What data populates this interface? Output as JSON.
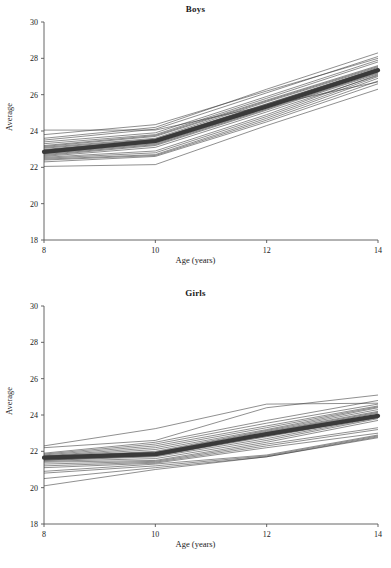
{
  "figure": {
    "width": 391,
    "height": 568,
    "background": "#ffffff",
    "line_color": "#333333",
    "mean_line_color": "#3a3a3a",
    "axis_color": "#555555"
  },
  "chart_data": [
    {
      "type": "line",
      "panel": "boys",
      "title": "Boys",
      "xlabel": "Age (years)",
      "ylabel": "Average",
      "x": [
        8,
        10,
        12,
        14
      ],
      "xlim": [
        8,
        14
      ],
      "ylim": [
        18,
        30
      ],
      "xticks": [
        8,
        10,
        12,
        14
      ],
      "yticks": [
        18,
        20,
        22,
        24,
        26,
        28,
        30
      ],
      "xtick_labels": [
        "8",
        "10",
        "12",
        "14"
      ],
      "ytick_labels": [
        "18",
        "20",
        "22",
        "24",
        "26",
        "28",
        "30"
      ],
      "grid": false,
      "legend": "none",
      "series": [
        {
          "name": "subject-01",
          "values": [
            24.05,
            24.05,
            25.4,
            26.7
          ]
        },
        {
          "name": "subject-02",
          "values": [
            23.6,
            24.2,
            26.3,
            28.3
          ]
        },
        {
          "name": "subject-03",
          "values": [
            23.5,
            24.1,
            26.1,
            28.1
          ]
        },
        {
          "name": "subject-04",
          "values": [
            23.4,
            23.9,
            25.9,
            27.9
          ]
        },
        {
          "name": "subject-05",
          "values": [
            23.3,
            23.8,
            25.8,
            27.8
          ]
        },
        {
          "name": "subject-06",
          "values": [
            23.2,
            23.75,
            25.7,
            27.6
          ]
        },
        {
          "name": "subject-07",
          "values": [
            23.1,
            23.6,
            25.6,
            27.5
          ]
        },
        {
          "name": "subject-08",
          "values": [
            23.05,
            23.55,
            25.5,
            27.45
          ]
        },
        {
          "name": "subject-09",
          "values": [
            22.95,
            23.5,
            25.45,
            27.4
          ]
        },
        {
          "name": "subject-10",
          "values": [
            22.9,
            23.45,
            25.4,
            27.35
          ]
        },
        {
          "name": "subject-11",
          "values": [
            22.85,
            23.4,
            25.35,
            27.3
          ]
        },
        {
          "name": "subject-12",
          "values": [
            22.8,
            23.35,
            25.3,
            27.3
          ]
        },
        {
          "name": "subject-13",
          "values": [
            22.75,
            23.3,
            25.25,
            27.25
          ]
        },
        {
          "name": "subject-14",
          "values": [
            22.7,
            23.25,
            25.2,
            27.2
          ]
        },
        {
          "name": "subject-15",
          "values": [
            22.65,
            23.2,
            25.15,
            27.15
          ]
        },
        {
          "name": "subject-16",
          "values": [
            22.55,
            22.9,
            24.9,
            27.1
          ]
        },
        {
          "name": "subject-17",
          "values": [
            22.5,
            22.8,
            24.8,
            27.0
          ]
        },
        {
          "name": "subject-18",
          "values": [
            22.45,
            22.7,
            24.7,
            26.9
          ]
        },
        {
          "name": "subject-19",
          "values": [
            22.4,
            22.65,
            24.6,
            26.75
          ]
        },
        {
          "name": "subject-20",
          "values": [
            22.3,
            22.6,
            24.5,
            26.6
          ]
        },
        {
          "name": "subject-21",
          "values": [
            22.05,
            22.15,
            24.3,
            26.3
          ]
        },
        {
          "name": "subject-22",
          "values": [
            23.8,
            24.35,
            26.2,
            28.0
          ]
        },
        {
          "name": "subject-23",
          "values": [
            23.15,
            23.7,
            25.65,
            27.55
          ]
        },
        {
          "name": "subject-24",
          "values": [
            22.6,
            23.1,
            25.05,
            27.05
          ]
        },
        {
          "name": "subject-25",
          "values": [
            22.98,
            23.52,
            25.48,
            27.42
          ]
        }
      ],
      "mean_series": {
        "name": "mean",
        "values": [
          22.85,
          23.45,
          25.35,
          27.35
        ]
      }
    },
    {
      "type": "line",
      "panel": "girls",
      "title": "Girls",
      "xlabel": "Age (years)",
      "ylabel": "Average",
      "x": [
        8,
        10,
        12,
        14
      ],
      "xlim": [
        8,
        14
      ],
      "ylim": [
        18,
        30
      ],
      "xticks": [
        8,
        10,
        12,
        14
      ],
      "yticks": [
        18,
        20,
        22,
        24,
        26,
        28,
        30
      ],
      "xtick_labels": [
        "8",
        "10",
        "12",
        "14"
      ],
      "ytick_labels": [
        "18",
        "20",
        "22",
        "24",
        "26",
        "28",
        "30"
      ],
      "grid": false,
      "legend": "none",
      "series": [
        {
          "name": "subject-01",
          "values": [
            22.3,
            23.25,
            24.6,
            24.65
          ]
        },
        {
          "name": "subject-02",
          "values": [
            22.2,
            22.6,
            24.4,
            25.1
          ]
        },
        {
          "name": "subject-03",
          "values": [
            21.9,
            22.5,
            23.7,
            24.8
          ]
        },
        {
          "name": "subject-04",
          "values": [
            21.85,
            22.4,
            23.55,
            24.6
          ]
        },
        {
          "name": "subject-05",
          "values": [
            21.8,
            22.3,
            23.4,
            24.5
          ]
        },
        {
          "name": "subject-06",
          "values": [
            21.75,
            22.2,
            23.3,
            24.45
          ]
        },
        {
          "name": "subject-07",
          "values": [
            21.72,
            22.1,
            23.2,
            24.4
          ]
        },
        {
          "name": "subject-08",
          "values": [
            21.7,
            22.0,
            23.15,
            24.3
          ]
        },
        {
          "name": "subject-09",
          "values": [
            21.68,
            21.95,
            23.1,
            24.2
          ]
        },
        {
          "name": "subject-10",
          "values": [
            21.65,
            21.9,
            23.0,
            24.1
          ]
        },
        {
          "name": "subject-11",
          "values": [
            21.6,
            21.85,
            22.95,
            24.0
          ]
        },
        {
          "name": "subject-12",
          "values": [
            21.58,
            21.8,
            22.9,
            23.95
          ]
        },
        {
          "name": "subject-13",
          "values": [
            21.55,
            21.78,
            22.85,
            23.9
          ]
        },
        {
          "name": "subject-14",
          "values": [
            21.5,
            21.7,
            22.7,
            23.85
          ]
        },
        {
          "name": "subject-15",
          "values": [
            21.45,
            21.6,
            22.6,
            23.8
          ]
        },
        {
          "name": "subject-16",
          "values": [
            21.4,
            21.5,
            22.5,
            23.7
          ]
        },
        {
          "name": "subject-17",
          "values": [
            21.3,
            21.45,
            22.4,
            23.3
          ]
        },
        {
          "name": "subject-18",
          "values": [
            21.2,
            21.4,
            22.3,
            23.2
          ]
        },
        {
          "name": "subject-19",
          "values": [
            21.1,
            21.35,
            22.2,
            23.0
          ]
        },
        {
          "name": "subject-20",
          "values": [
            20.9,
            21.3,
            21.8,
            22.9
          ]
        },
        {
          "name": "subject-21",
          "values": [
            20.8,
            21.2,
            21.75,
            22.85
          ]
        },
        {
          "name": "subject-22",
          "values": [
            20.5,
            21.1,
            21.7,
            22.8
          ]
        },
        {
          "name": "subject-23",
          "values": [
            20.1,
            21.0,
            21.7,
            22.75
          ]
        },
        {
          "name": "subject-24",
          "values": [
            21.62,
            21.88,
            23.05,
            24.15
          ]
        },
        {
          "name": "subject-25",
          "values": [
            21.52,
            21.75,
            22.8,
            23.88
          ]
        }
      ],
      "mean_series": {
        "name": "mean",
        "values": [
          21.65,
          21.85,
          22.95,
          23.95
        ]
      }
    }
  ]
}
